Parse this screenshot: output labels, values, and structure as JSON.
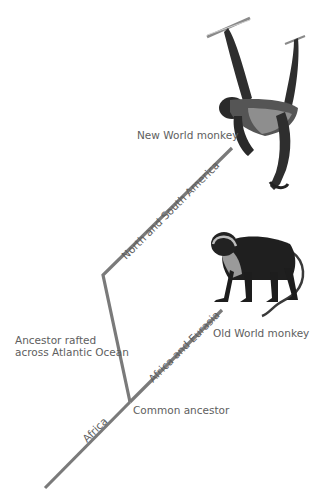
{
  "diagram": {
    "line_color": "#7a7a7a",
    "nodes": {
      "root": {
        "label": "",
        "x": 45,
        "y": 488
      },
      "common_ancestor": {
        "label": "Common ancestor",
        "x": 130,
        "y": 402
      },
      "kink": {
        "label": "",
        "x": 103,
        "y": 275
      },
      "new_world": {
        "label": "New World monkey",
        "x": 232,
        "y": 148
      },
      "old_world": {
        "label": "Old World monkey",
        "x": 222,
        "y": 310
      }
    },
    "branch_labels": {
      "africa": "Africa",
      "africa_eurasia": "Africa and Eurasia",
      "north_south_america": "North and South America"
    },
    "annotations": {
      "rafted_line1": "Ancestor rafted",
      "rafted_line2": "across Atlantic Ocean"
    },
    "illustrations": {
      "new_world": "spider-monkey-illustration",
      "old_world": "colobus-monkey-illustration"
    }
  }
}
